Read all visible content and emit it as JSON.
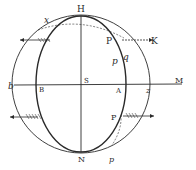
{
  "diagram": {
    "type": "geometric-figure",
    "labels": {
      "top": "H",
      "top_left": "x",
      "upper_point": "P",
      "upper_arrow_target": "K",
      "inner_p": "p",
      "inner_q": "q",
      "left_outer": "b",
      "left_inner": "B",
      "center": "S",
      "right_inner": "A",
      "right_outer": "z",
      "right_end": "M",
      "lower_point": "P",
      "bottom": "N",
      "bottom_right": "p"
    },
    "colors": {
      "ink": "#2a2a2a",
      "background": "#ffffff"
    }
  }
}
